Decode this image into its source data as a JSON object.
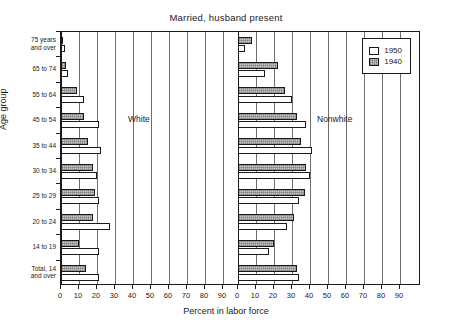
{
  "chart_data": {
    "type": "bar",
    "title": "Married, husband present",
    "subtitle": "",
    "xlabel": "Percent in labor force",
    "ylabel": "Age group",
    "orientation": "horizontal",
    "grid": true,
    "legend_position": "top-right",
    "xlim": [
      0,
      90
    ],
    "xticks": [
      0,
      10,
      20,
      30,
      40,
      50,
      60,
      70,
      80,
      90
    ],
    "xticklabels": [
      "0",
      "10",
      "20",
      "30",
      "40",
      "50",
      "60",
      "70",
      "80",
      "90"
    ],
    "categories": [
      "75 years\nand over",
      "65 to 74",
      "55 to 64",
      "45 to 54",
      "35 to 44",
      "30 to 34",
      "25 to 29",
      "20 to 24",
      "14 to 19",
      "Total, 14\nand over"
    ],
    "panels": [
      {
        "name": "White",
        "label": "White",
        "series": [
          {
            "name": "1950",
            "values": [
              2.0,
              4.0,
              13.0,
              21.0,
              22.0,
              20.0,
              21.0,
              27.0,
              21.0,
              21.0
            ]
          },
          {
            "name": "1940",
            "values": [
              1.0,
              3.0,
              9.0,
              13.0,
              15.0,
              18.0,
              19.0,
              18.0,
              10.0,
              14.0
            ]
          }
        ]
      },
      {
        "name": "Nonwhite",
        "label": "Nonwhite",
        "series": [
          {
            "name": "1950",
            "values": [
              4.0,
              15.0,
              30.0,
              38.0,
              41.0,
              40.0,
              34.0,
              27.0,
              17.0,
              34.0
            ]
          },
          {
            "name": "1940",
            "values": [
              8.0,
              22.0,
              26.0,
              33.0,
              35.0,
              38.0,
              37.0,
              31.0,
              20.0,
              33.0
            ]
          }
        ]
      }
    ],
    "legend": [
      {
        "label": "1950",
        "swatch": "white"
      },
      {
        "label": "1940",
        "swatch": "hatched-gray"
      }
    ],
    "colors": {
      "y1950": "#ffffff",
      "y1940": "#c9c9c9",
      "axis": "#1a1a1a",
      "grid": "#6f6f6f",
      "background": "#ffffff"
    }
  }
}
